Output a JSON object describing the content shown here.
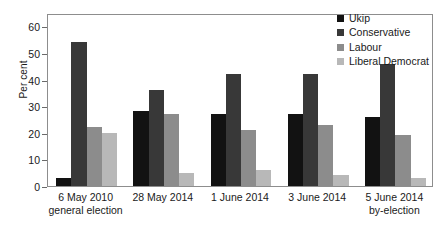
{
  "chart_data": {
    "type": "bar",
    "title": "",
    "xlabel": "",
    "ylabel": "Per cent",
    "ylim": [
      0,
      65
    ],
    "yticks": [
      0,
      10,
      20,
      30,
      40,
      50,
      60
    ],
    "grid": false,
    "legend_position": "top-right",
    "categories": [
      "6 May 2010 general election",
      "28 May 2014",
      "1 June 2014",
      "3 June 2014",
      "5 June 2014 by-election"
    ],
    "category_lines": [
      [
        "6 May 2010",
        "general election"
      ],
      [
        "28 May 2014",
        ""
      ],
      [
        "1 June 2014",
        ""
      ],
      [
        "3 June 2014",
        ""
      ],
      [
        "5 June 2014",
        "by-election"
      ]
    ],
    "series": [
      {
        "name": "Ukip",
        "color": "#121212",
        "values": [
          3,
          28,
          27,
          27,
          26
        ]
      },
      {
        "name": "Conservative",
        "color": "#383838",
        "values": [
          54,
          36,
          42,
          42,
          46
        ]
      },
      {
        "name": "Labour",
        "color": "#8c8c8c",
        "values": [
          22,
          27,
          21,
          23,
          19
        ]
      },
      {
        "name": "Liberal Democrat",
        "color": "#b8b8b8",
        "values": [
          20,
          5,
          6,
          4,
          3
        ]
      }
    ]
  },
  "axis": {
    "y_title": "Per cent",
    "y_tick_labels": [
      "0",
      "10",
      "20",
      "30",
      "40",
      "50",
      "60"
    ]
  }
}
